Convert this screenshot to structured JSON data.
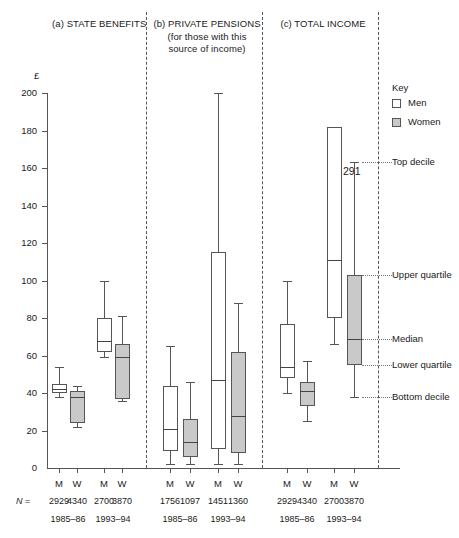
{
  "figure": {
    "y_axis_label": "£",
    "n_prefix": "N =",
    "annotation_291": "291"
  },
  "panels": [
    {
      "id": "a",
      "title": "(a) STATE BENEFITS",
      "subtitle": ""
    },
    {
      "id": "b",
      "title": "(b) PRIVATE PENSIONS",
      "subtitle": "(for those with this\nsource of income)",
      "subtitle_l1": "(for those with this",
      "subtitle_l2": "source of income)"
    },
    {
      "id": "c",
      "title": "(c) TOTAL INCOME",
      "subtitle": ""
    }
  ],
  "key": {
    "title": "Key",
    "men_label": "Men",
    "women_label": "Women",
    "men_color": "#ffffff",
    "women_color": "#c9c9c9",
    "reference_labels": [
      {
        "name": "top-decile",
        "label": "Top decile",
        "value": 163
      },
      {
        "name": "upper-quartile",
        "label": "Upper quartile",
        "value": 103
      },
      {
        "name": "median",
        "label": "Median",
        "value": 69
      },
      {
        "name": "lower-quartile",
        "label": "Lower quartile",
        "value": 55
      },
      {
        "name": "bottom-decile",
        "label": "Bottom decile",
        "value": 38
      }
    ]
  },
  "axis": {
    "ticks": [
      0,
      20,
      40,
      60,
      80,
      100,
      120,
      140,
      160,
      180,
      200
    ],
    "tick_labels": [
      "0",
      "20",
      "40",
      "60",
      "80",
      "100",
      "120",
      "140",
      "160",
      "180",
      "200"
    ],
    "ylim": [
      0,
      200
    ]
  },
  "groups": {
    "sex_labels": [
      "M",
      "W",
      "M",
      "W"
    ],
    "year_labels": [
      "1985–86",
      "1993–94"
    ]
  },
  "chart_data": {
    "type": "boxplot",
    "title": "",
    "ylabel": "£",
    "ylim": [
      0,
      200
    ],
    "grid": false,
    "stat_order": [
      "bottom_decile",
      "lower_quartile",
      "median",
      "upper_quartile",
      "top_decile"
    ],
    "panels": [
      {
        "id": "a",
        "title": "(a) STATE BENEFITS",
        "boxes": [
          {
            "sex": "Men",
            "sex_label": "M",
            "year": "1985–86",
            "n": 2929,
            "bottom_decile": 38,
            "lower_quartile": 40,
            "median": 42,
            "upper_quartile": 45,
            "top_decile": 54
          },
          {
            "sex": "Women",
            "sex_label": "W",
            "year": "1985–86",
            "n": 4340,
            "bottom_decile": 22,
            "lower_quartile": 24,
            "median": 38,
            "upper_quartile": 41,
            "top_decile": 44
          },
          {
            "sex": "Men",
            "sex_label": "M",
            "year": "1993–94",
            "n": 2700,
            "bottom_decile": 59,
            "lower_quartile": 62,
            "median": 68,
            "upper_quartile": 80,
            "top_decile": 100
          },
          {
            "sex": "Women",
            "sex_label": "W",
            "year": "1993–94",
            "n": 3870,
            "bottom_decile": 36,
            "lower_quartile": 37,
            "median": 59,
            "upper_quartile": 66,
            "top_decile": 81
          }
        ]
      },
      {
        "id": "b",
        "title": "(b) PRIVATE PENSIONS",
        "boxes": [
          {
            "sex": "Men",
            "sex_label": "M",
            "year": "1985–86",
            "n": 1756,
            "bottom_decile": 2,
            "lower_quartile": 9,
            "median": 21,
            "upper_quartile": 44,
            "top_decile": 65
          },
          {
            "sex": "Women",
            "sex_label": "W",
            "year": "1985–86",
            "n": 1097,
            "bottom_decile": 2,
            "lower_quartile": 6,
            "median": 14,
            "upper_quartile": 26,
            "top_decile": 46
          },
          {
            "sex": "Men",
            "sex_label": "M",
            "year": "1993–94",
            "n": 1451,
            "bottom_decile": 2,
            "lower_quartile": 10,
            "median": 47,
            "upper_quartile": 115,
            "top_decile": 200
          },
          {
            "sex": "Women",
            "sex_label": "W",
            "year": "1993–94",
            "n": 1360,
            "bottom_decile": 2,
            "lower_quartile": 8,
            "median": 28,
            "upper_quartile": 62,
            "top_decile": 88
          }
        ]
      },
      {
        "id": "c",
        "title": "(c) TOTAL INCOME",
        "boxes": [
          {
            "sex": "Men",
            "sex_label": "M",
            "year": "1985–86",
            "n": 2929,
            "bottom_decile": 40,
            "lower_quartile": 48,
            "median": 54,
            "upper_quartile": 77,
            "top_decile": 100
          },
          {
            "sex": "Women",
            "sex_label": "W",
            "year": "1985–86",
            "n": 4340,
            "bottom_decile": 25,
            "lower_quartile": 33,
            "median": 41,
            "upper_quartile": 46,
            "top_decile": 57
          },
          {
            "sex": "Men",
            "sex_label": "M",
            "year": "1993–94",
            "n": 2700,
            "bottom_decile": 66,
            "lower_quartile": 80,
            "median": 111,
            "upper_quartile": 182,
            "top_decile": 291,
            "top_decile_broken": true,
            "top_decile_label": "291"
          },
          {
            "sex": "Women",
            "sex_label": "W",
            "year": "1993–94",
            "n": 3870,
            "bottom_decile": 38,
            "lower_quartile": 55,
            "median": 69,
            "upper_quartile": 103,
            "top_decile": 163
          }
        ]
      }
    ]
  }
}
